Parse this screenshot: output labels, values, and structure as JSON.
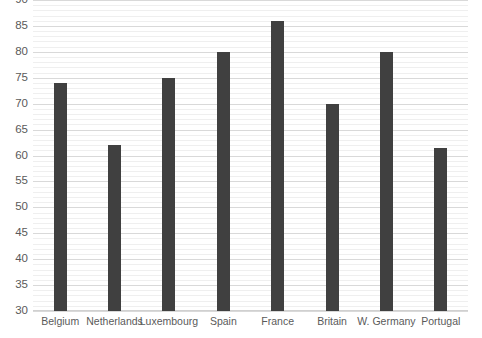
{
  "chart_data": {
    "type": "bar",
    "title": "",
    "subtitle": "",
    "xlabel": "",
    "ylabel": "",
    "categories": [
      "Belgium",
      "Netherlands",
      "Luxembourg",
      "Spain",
      "France",
      "Britain",
      "W. Germany",
      "Portugal"
    ],
    "values": [
      74,
      62,
      75,
      80,
      86,
      70,
      80,
      61.5
    ],
    "series": [
      {
        "name": "",
        "values": [
          74,
          62,
          75,
          80,
          86,
          70,
          80,
          61.5
        ]
      }
    ],
    "ylim": [
      30,
      90
    ],
    "ytick_labels": [
      "30",
      "35",
      "40",
      "45",
      "50",
      "55",
      "60",
      "65",
      "70",
      "75",
      "80",
      "85",
      "90"
    ],
    "ytick_values": [
      30,
      35,
      40,
      45,
      50,
      55,
      60,
      65,
      70,
      75,
      80,
      85,
      90
    ],
    "ytick_step": 5,
    "minor_gridline_step": 1,
    "grid": true,
    "grid_axis": "y",
    "legend": false,
    "legend_position": "none",
    "bar_color": "#404040",
    "gridline_color": "#d9d9d9",
    "minor_gridline_color": "#efefef",
    "tick_label_color": "#5a5a5a",
    "background_color": "#ffffff",
    "clipped_top_label": "95"
  }
}
